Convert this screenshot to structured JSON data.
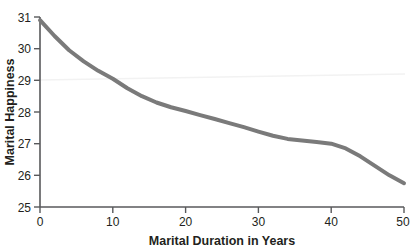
{
  "chart_data": {
    "type": "line",
    "title": "",
    "xlabel": "Marital Duration in Years",
    "ylabel": "Marital Happiness",
    "xlim": [
      0,
      50
    ],
    "ylim": [
      25,
      31
    ],
    "xticks": [
      0,
      10,
      20,
      30,
      40,
      50
    ],
    "yticks": [
      25,
      26,
      27,
      28,
      29,
      30,
      31
    ],
    "xtick_labels": [
      "0",
      "10",
      "20",
      "30",
      "40",
      "50"
    ],
    "ytick_labels": [
      "25",
      "26",
      "27",
      "28",
      "29",
      "30",
      "31"
    ],
    "grid": false,
    "legend": "none",
    "series": [
      {
        "name": "Marital Happiness",
        "color": "#7a7a7a",
        "line_width": 4,
        "x": [
          0,
          2,
          4,
          6,
          8,
          10,
          12,
          14,
          16,
          18,
          20,
          22,
          24,
          26,
          28,
          30,
          32,
          34,
          36,
          38,
          40,
          42,
          44,
          46,
          48,
          50
        ],
        "values": [
          30.9,
          30.4,
          29.95,
          29.6,
          29.3,
          29.05,
          28.75,
          28.5,
          28.3,
          28.15,
          28.03,
          27.9,
          27.78,
          27.65,
          27.52,
          27.38,
          27.25,
          27.15,
          27.1,
          27.05,
          27.0,
          26.85,
          26.6,
          26.3,
          26.0,
          25.75
        ]
      }
    ],
    "axis_color": "#58595b",
    "text_color": "#231f20",
    "background": "#ffffff"
  },
  "axes": {
    "x_axis_label": "Marital Duration in Years",
    "y_axis_label": "Marital Happiness"
  }
}
